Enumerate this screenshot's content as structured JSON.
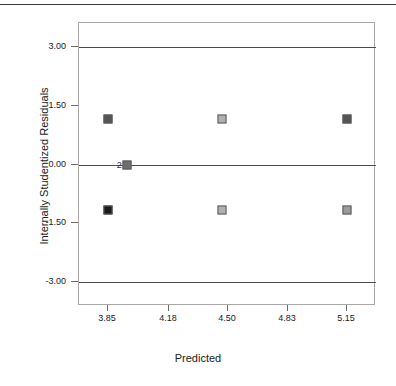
{
  "chart_data": {
    "type": "scatter",
    "title": "",
    "xlabel": "Predicted",
    "ylabel": "Internally Studentized Residuals",
    "xlim": [
      3.69,
      5.31
    ],
    "ylim": [
      -3.6,
      3.6
    ],
    "grid": false,
    "legend": "none",
    "xticks": [
      "3.85",
      "4.18",
      "4.50",
      "4.83",
      "5.15"
    ],
    "xtick_values": [
      3.85,
      4.18,
      4.5,
      4.83,
      5.15
    ],
    "yticks": [
      "3.00",
      "1.50",
      "0.00",
      "-1.50",
      "-3.00"
    ],
    "ytick_values": [
      3.0,
      1.5,
      0.0,
      -1.5,
      -3.0
    ],
    "reference_lines": [
      {
        "y": 3.0,
        "name": "upper-limit-line"
      },
      {
        "y": 0.0,
        "name": "zero-line"
      },
      {
        "y": -3.0,
        "name": "lower-limit-line"
      }
    ],
    "points": [
      {
        "x": 3.85,
        "y": 1.15,
        "color": "#545454",
        "label": ""
      },
      {
        "x": 4.47,
        "y": 1.15,
        "color": "#b0b0b0",
        "label": ""
      },
      {
        "x": 5.15,
        "y": 1.15,
        "color": "#545454",
        "label": ""
      },
      {
        "x": 3.95,
        "y": 0.0,
        "color": "#6e6e6e",
        "label": "2"
      },
      {
        "x": 3.85,
        "y": -1.15,
        "color": "#1a1a1a",
        "label": ""
      },
      {
        "x": 4.47,
        "y": -1.15,
        "color": "#b0b0b0",
        "label": ""
      },
      {
        "x": 5.15,
        "y": -1.15,
        "color": "#9a9a9a",
        "label": ""
      }
    ]
  },
  "axis": {
    "x_title": "Predicted",
    "y_title": "Internally Studentized Residuals"
  },
  "colors": {
    "frame": "#a9a9a9",
    "reference_line": "#4a4a4a",
    "tick": "#6b6b6b",
    "text": "#1a1a1a",
    "top_rule": "#3a3a3a"
  }
}
